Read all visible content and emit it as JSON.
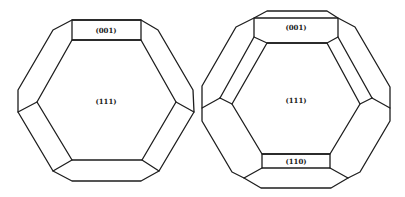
{
  "figure": {
    "stroke_color": "#1e1e1e",
    "background": "#ffffff"
  },
  "crystals": [
    {
      "id": "left",
      "outline": "72,20 141,20 158,30 193,90 194,112 159,171 141,181 72,181 53,171 18,112 18,90 53,30",
      "faces": [
        {
          "name": "face-001",
          "points": "72,20 141,20 141,40 72,40"
        },
        {
          "name": "face-111",
          "points": "72,40 141,40 176,102 142,160 72,160 37,102"
        }
      ],
      "edges": [
        "37,102 18,112",
        "176,102 194,112",
        "72,160 53,171",
        "142,160 159,171"
      ],
      "labels": [
        {
          "text": "(001)",
          "x": 106,
          "y": 31
        },
        {
          "text": "(111)",
          "x": 106,
          "y": 102
        }
      ]
    },
    {
      "id": "right",
      "outline": "267,11 327,11 338,18 355,27 390,87 390,121 360,172 348,178 331,188 261,188 244,178 232,172 202,121 202,86 236,27 254,18",
      "faces": [
        {
          "name": "face-001",
          "points": "254,18 338,18 338,37 327,43 267,43 254,37"
        },
        {
          "name": "face-111",
          "points": "267,43 327,43 360,104 330,154 262,154 232,104"
        },
        {
          "name": "face-110",
          "points": "262,154 330,154 330,168 262,168"
        }
      ],
      "edges": [
        "254,37 220,98",
        "220,98 232,104",
        "202,108 220,98",
        "338,37 372,98",
        "372,98 360,104",
        "372,98 390,108",
        "262,168 244,178",
        "330,168 348,178"
      ],
      "labels": [
        {
          "text": "(001)",
          "x": 296,
          "y": 28
        },
        {
          "text": "(111)",
          "x": 296,
          "y": 101
        },
        {
          "text": "(110)",
          "x": 296,
          "y": 162
        }
      ]
    }
  ]
}
